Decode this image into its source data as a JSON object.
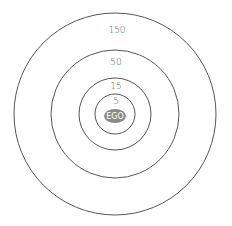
{
  "diagram": {
    "type": "concentric-circles",
    "center": {
      "label": "EGO",
      "fill": "#8a8a8a"
    },
    "rings": [
      {
        "label": "5"
      },
      {
        "label": "15"
      },
      {
        "label": "50"
      },
      {
        "label": "150"
      }
    ],
    "stroke_color": "#555555"
  }
}
